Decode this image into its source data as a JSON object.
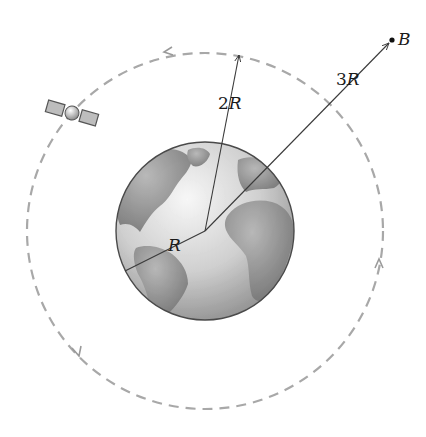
{
  "diagram": {
    "labels": {
      "earth_radius": {
        "coef": "",
        "var": "R"
      },
      "orbit_radius": {
        "coef": "2",
        "var": "R"
      },
      "point_distance": {
        "coef": "3",
        "var": "R"
      },
      "point": {
        "var": "B"
      }
    },
    "colors": {
      "orbit_dash": "#a8a8a8",
      "earth_ocean": "#d9d9d9",
      "earth_land": "#8f8f8f",
      "earth_outline": "#4a4a4a",
      "radius_line": "#3a3a3a",
      "text": "#1a1a1a"
    },
    "geometry": {
      "earth_center": [
        205,
        231
      ],
      "earth_radius_px": 90,
      "orbit_radius_px": 178,
      "point_b": [
        392,
        40
      ]
    },
    "elements": [
      "earth",
      "dashed-circular-orbit",
      "satellite",
      "orbit-direction-arrows",
      "radius-R",
      "radius-2R",
      "distance-3R",
      "point-B"
    ]
  }
}
